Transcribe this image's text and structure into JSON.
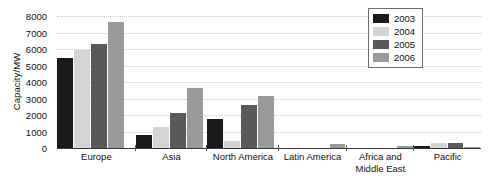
{
  "chart_data": {
    "type": "bar",
    "title": "",
    "xlabel": "",
    "ylabel": "Capacity/MW",
    "ylim": [
      0,
      8000
    ],
    "ytick_step": 1000,
    "yticks": [
      "8000",
      "7000",
      "6000",
      "5000",
      "4000",
      "3000",
      "2000",
      "1000",
      "0"
    ],
    "grid": true,
    "legend_position": "top-right",
    "categories": [
      "Europe",
      "Asia",
      "North America",
      "Latin America",
      "Africa and\nMiddle East",
      "Pacific"
    ],
    "series": [
      {
        "name": "2003",
        "color": "#1a1a1a",
        "values": [
          5450,
          800,
          1750,
          0,
          0,
          110
        ]
      },
      {
        "name": "2004",
        "color": "#d4d4d4",
        "values": [
          5950,
          1250,
          450,
          0,
          0,
          280
        ]
      },
      {
        "name": "2005",
        "color": "#595959",
        "values": [
          6300,
          2150,
          2600,
          0,
          0,
          290
        ]
      },
      {
        "name": "2006",
        "color": "#9a9a9a",
        "values": [
          7650,
          3650,
          3150,
          250,
          140,
          90
        ]
      }
    ]
  },
  "legend": {
    "entries": [
      {
        "label": "2003"
      },
      {
        "label": "2004"
      },
      {
        "label": "2005"
      },
      {
        "label": "2006"
      }
    ]
  },
  "colors": {
    "axis": "#3a3a3a",
    "grid": "#c9c9c9",
    "text": "#111111",
    "background": "#ffffff"
  }
}
